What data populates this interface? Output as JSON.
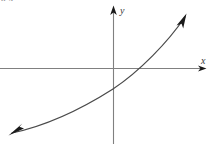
{
  "figure": {
    "kind": "cartesian-graph",
    "width": 213,
    "height": 144,
    "background_color": "#ffffff",
    "corner_fragment_text": "8.4",
    "axis_color": "#808080",
    "curve_color": "#4a4a4a",
    "arrow_color": "#1a1a1a"
  },
  "axes": {
    "x_label": "x",
    "y_label": "y",
    "origin": {
      "x": 113,
      "y": 68
    },
    "x_axis": {
      "x1": 0,
      "y1": 68,
      "x2": 207,
      "y2": 68,
      "has_arrow_right": true
    },
    "y_axis": {
      "x1": 113,
      "y1": 144,
      "x2": 113,
      "y2": 11,
      "has_arrow_up": true
    }
  },
  "chart_data": {
    "type": "line",
    "title": "",
    "xlabel": "x",
    "ylabel": "y",
    "grid": false,
    "legend": null,
    "curve_path": "M 12 133 C 45 126, 80 110, 113 89 C 140 71, 168 42, 185 17",
    "points_px": [
      {
        "x": 12,
        "y": 133
      },
      {
        "x": 40,
        "y": 127
      },
      {
        "x": 70,
        "y": 116
      },
      {
        "x": 95,
        "y": 101
      },
      {
        "x": 113,
        "y": 89
      },
      {
        "x": 128,
        "y": 78
      },
      {
        "x": 139,
        "y": 68
      },
      {
        "x": 155,
        "y": 52
      },
      {
        "x": 170,
        "y": 35
      },
      {
        "x": 185,
        "y": 17
      }
    ],
    "y_intercept_px": {
      "x": 113,
      "y": 89
    },
    "x_intercept_px": {
      "x": 139,
      "y": 68
    },
    "start_arrow": {
      "x": 12,
      "y": 133,
      "direction": "down-left"
    },
    "end_arrow": {
      "x": 185,
      "y": 17,
      "direction": "up-right"
    }
  }
}
